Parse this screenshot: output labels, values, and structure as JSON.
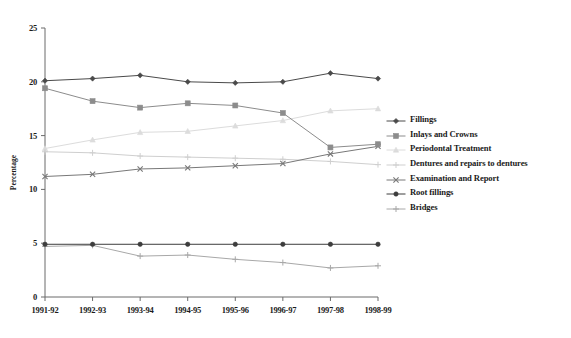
{
  "chart_data": {
    "type": "line",
    "title": "",
    "xlabel": "",
    "ylabel": "Percentage",
    "categories": [
      "1991-92",
      "1992-93",
      "1993-94",
      "1994-95",
      "1995-96",
      "1996-97",
      "1997-98",
      "1998-99"
    ],
    "ylim": [
      0,
      25
    ],
    "yticks": [
      0,
      5,
      10,
      15,
      20,
      25
    ],
    "ytick_labels": [
      "0",
      "5",
      "10",
      "15",
      "20",
      "25"
    ],
    "grid": false,
    "legend_position": "right",
    "series": [
      {
        "name": "Fillings",
        "color": "#4a4a4a",
        "marker": "diamond",
        "values": [
          20.1,
          20.3,
          20.6,
          20.0,
          19.9,
          20.0,
          20.8,
          20.3
        ]
      },
      {
        "name": "Inlays and Crowns",
        "color": "#8c8c8c",
        "marker": "square",
        "values": [
          19.4,
          18.2,
          17.6,
          18.0,
          17.8,
          17.1,
          13.9,
          14.2
        ]
      },
      {
        "name": "Periodontal Treatment",
        "color": "#dcdcdc",
        "marker": "triangle",
        "values": [
          13.8,
          14.6,
          15.3,
          15.4,
          15.9,
          16.4,
          17.3,
          17.5
        ]
      },
      {
        "name": "Dentures and repairs to dentures",
        "color": "#cfcfcf",
        "marker": "cross-plus",
        "values": [
          13.5,
          13.4,
          13.1,
          13.0,
          12.9,
          12.8,
          12.6,
          12.3
        ]
      },
      {
        "name": "Examination and Report",
        "color": "#787878",
        "marker": "x-mark",
        "values": [
          11.2,
          11.4,
          11.9,
          12.0,
          12.2,
          12.4,
          13.3,
          14.0
        ]
      },
      {
        "name": "Root fillings",
        "color": "#3d3d3d",
        "marker": "circle",
        "values": [
          4.9,
          4.9,
          4.9,
          4.9,
          4.9,
          4.9,
          4.9,
          4.9
        ]
      },
      {
        "name": "Bridges",
        "color": "#a8a8a8",
        "marker": "cross-plus",
        "values": [
          4.7,
          4.8,
          3.8,
          3.9,
          3.5,
          3.2,
          2.7,
          2.9
        ]
      }
    ]
  },
  "axis": {
    "y_title": "Percentage"
  }
}
